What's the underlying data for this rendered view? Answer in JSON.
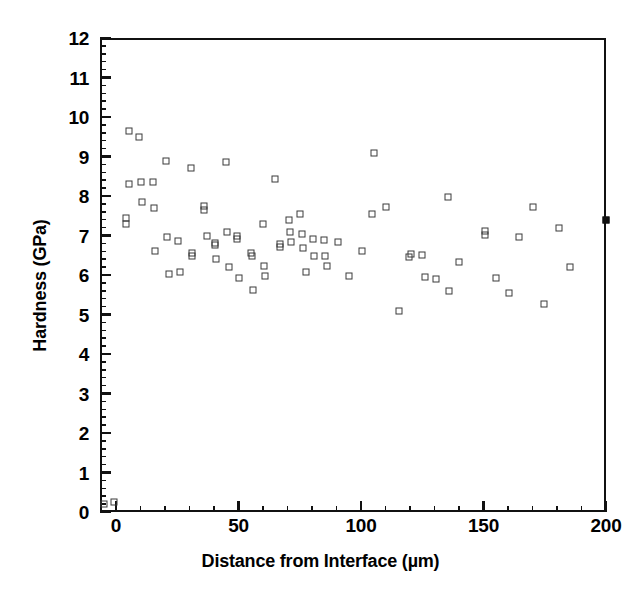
{
  "chart_data": {
    "type": "scatter",
    "title": "",
    "xlabel": "Distance from Interface (µm)",
    "ylabel": "Hardness (GPa)",
    "xlim": [
      0,
      200
    ],
    "ylim": [
      0,
      12
    ],
    "grid": false,
    "legend": null,
    "x_ticks": [
      0,
      50,
      100,
      150,
      200
    ],
    "x_tick_labels": [
      "0",
      "50",
      "100",
      "150",
      "200"
    ],
    "x_minor_tick_step": 10,
    "y_ticks": [
      0,
      1,
      2,
      3,
      4,
      5,
      6,
      7,
      8,
      9,
      10,
      11,
      12
    ],
    "y_tick_labels": [
      "0",
      "1",
      "2",
      "3",
      "4",
      "5",
      "6",
      "7",
      "8",
      "9",
      "10",
      "11",
      "12"
    ],
    "y_minor_tick_step": 0.2,
    "marker": "open-square",
    "marker_color": "#3a3a3a",
    "frame_color": "#111111",
    "background_color": "#ffffff",
    "series": [
      {
        "name": "Hardness measurements",
        "marker": "open-square",
        "points": [
          [
            -5.0,
            0.2
          ],
          [
            -1.0,
            0.25
          ],
          [
            4.0,
            7.45
          ],
          [
            4.0,
            7.3
          ],
          [
            5.5,
            9.65
          ],
          [
            5.5,
            8.3
          ],
          [
            9.5,
            9.5
          ],
          [
            10.0,
            8.35
          ],
          [
            10.5,
            7.85
          ],
          [
            15.0,
            8.35
          ],
          [
            15.5,
            7.7
          ],
          [
            16.0,
            6.6
          ],
          [
            20.5,
            8.88
          ],
          [
            21.0,
            6.95
          ],
          [
            21.5,
            6.03
          ],
          [
            25.5,
            6.85
          ],
          [
            26.0,
            6.08
          ],
          [
            30.5,
            8.7
          ],
          [
            31.0,
            6.55
          ],
          [
            31.0,
            6.47
          ],
          [
            36.0,
            7.75
          ],
          [
            36.0,
            7.65
          ],
          [
            37.0,
            6.98
          ],
          [
            40.5,
            6.82
          ],
          [
            40.5,
            6.75
          ],
          [
            41.0,
            6.4
          ],
          [
            45.0,
            8.87
          ],
          [
            45.5,
            7.1
          ],
          [
            46.0,
            6.2
          ],
          [
            49.5,
            6.98
          ],
          [
            49.5,
            6.9
          ],
          [
            50.0,
            5.92
          ],
          [
            55.0,
            6.55
          ],
          [
            55.5,
            6.48
          ],
          [
            56.0,
            5.63
          ],
          [
            60.0,
            7.28
          ],
          [
            60.5,
            6.22
          ],
          [
            61.0,
            5.98
          ],
          [
            65.0,
            8.43
          ],
          [
            67.0,
            6.78
          ],
          [
            67.0,
            6.7
          ],
          [
            70.5,
            7.38
          ],
          [
            71.0,
            7.1
          ],
          [
            71.5,
            6.83
          ],
          [
            75.0,
            7.55
          ],
          [
            76.0,
            7.03
          ],
          [
            76.5,
            6.68
          ],
          [
            77.5,
            6.07
          ],
          [
            80.5,
            6.92
          ],
          [
            81.0,
            6.48
          ],
          [
            85.0,
            6.88
          ],
          [
            85.5,
            6.48
          ],
          [
            86.0,
            6.23
          ],
          [
            90.5,
            6.83
          ],
          [
            95.0,
            5.98
          ],
          [
            100.5,
            6.6
          ],
          [
            104.5,
            7.55
          ],
          [
            105.5,
            9.08
          ],
          [
            110.0,
            7.72
          ],
          [
            115.5,
            5.08
          ],
          [
            119.5,
            6.45
          ],
          [
            120.5,
            6.52
          ],
          [
            125.0,
            6.5
          ],
          [
            126.0,
            5.95
          ],
          [
            130.5,
            5.9
          ],
          [
            135.5,
            7.97
          ],
          [
            136.0,
            5.6
          ],
          [
            140.0,
            6.32
          ],
          [
            150.5,
            7.12
          ],
          [
            150.5,
            7.02
          ],
          [
            155.0,
            5.93
          ],
          [
            160.5,
            5.55
          ],
          [
            164.5,
            6.97
          ],
          [
            170.0,
            7.73
          ],
          [
            174.5,
            5.27
          ],
          [
            181.0,
            7.2
          ],
          [
            185.5,
            6.2
          ]
        ]
      },
      {
        "name": "Boundary marker",
        "marker": "filled-square",
        "points": [
          [
            200.0,
            7.4
          ]
        ]
      }
    ]
  }
}
